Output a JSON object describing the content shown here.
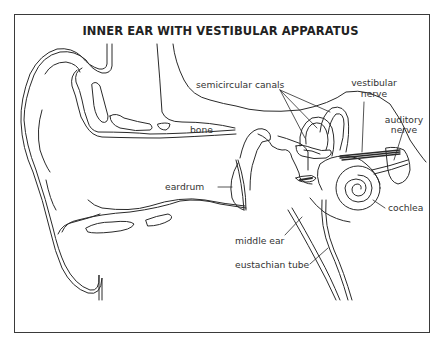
{
  "title": "INNER EAR WITH VESTIBULAR APPARATUS",
  "labels": {
    "semicircular_canals": "semicircular canals",
    "vestibular_nerve_line1": "vestibular",
    "vestibular_nerve_line2": "nerve",
    "auditory_nerve_line1": "auditory",
    "auditory_nerve_line2": "nerve",
    "bone": "bone",
    "eardrum": "eardrum",
    "cochlea": "cochlea",
    "middle_ear": "middle ear",
    "eustachian_tube": "eustachian tube"
  },
  "colors": {
    "line": "#2a2a2a",
    "text": "#333333",
    "background": "#ffffff"
  }
}
